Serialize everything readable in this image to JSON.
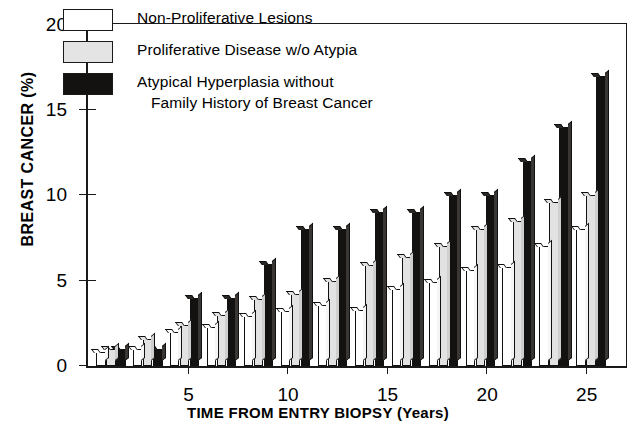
{
  "chart_data": {
    "type": "bar",
    "title": "",
    "xlabel": "TIME FROM ENTRY BIOPSY (Years)",
    "ylabel": "BREAST CANCER (%)",
    "ylim": [
      0,
      20
    ],
    "yticks": [
      0,
      5,
      10,
      15,
      20
    ],
    "ytick_labels": [
      "0",
      "5",
      "10",
      "15",
      "20"
    ],
    "xlim": [
      0,
      27
    ],
    "xticks": [
      5,
      10,
      15,
      20,
      25
    ],
    "xtick_labels": [
      "5",
      "10",
      "15",
      "20",
      "25"
    ],
    "grid": false,
    "legend_position": "top-left",
    "categories": [
      2,
      3,
      5,
      7,
      9,
      11,
      13,
      15,
      17,
      19,
      21,
      23,
      25
    ],
    "series": [
      {
        "name": "Non-Proliferative Lesions",
        "color": "#ffffff",
        "values": [
          0.8,
          1.0,
          2.0,
          2.5,
          3.0,
          3.5,
          3.8,
          4.5,
          5.0,
          5.7,
          6.0,
          7.0,
          8.0
        ]
      },
      {
        "name": "Proliferative Disease w/o Atypia",
        "color": "#e4e4e4",
        "values": [
          1.0,
          2.0,
          2.5,
          3.0,
          4.0,
          4.5,
          5.5,
          6.0,
          6.5,
          7.0,
          8.0,
          8.5,
          10.0
        ]
      },
      {
        "name": "Atypical Hyperplasia without Family History of Breast Cancer",
        "color": "#131210",
        "values": [
          1.0,
          1.0,
          4.0,
          4.0,
          6.0,
          8.0,
          8.0,
          9.0,
          9.0,
          10.0,
          10.0,
          10.0,
          12.0
        ]
      }
    ],
    "series3_values_full": [
      1.0,
      1.0,
      4.0,
      4.0,
      6.0,
      8.0,
      8.0,
      9.0,
      9.0,
      10.0,
      10.0,
      12.0,
      14.0,
      17.0
    ]
  },
  "legend": {
    "items": [
      {
        "swatch": "w",
        "line1": "Non-Proliferative Lesions",
        "line2": ""
      },
      {
        "swatch": "g",
        "line1": "Proliferative Disease w/o Atypia",
        "line2": ""
      },
      {
        "swatch": "k",
        "line1": "Atypical Hyperplasia without",
        "line2": "Family History of Breast Cancer"
      }
    ]
  },
  "axes": {
    "y_title": "BREAST CANCER (%)",
    "x_title": "TIME FROM ENTRY BIOPSY (Years)"
  }
}
